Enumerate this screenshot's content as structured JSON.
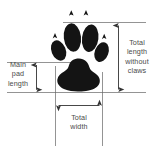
{
  "diagram": {
    "background_color": "#ffffff",
    "ink_color": "#111111",
    "line_color": "#555555",
    "text_color": "#4a4a4a",
    "labels": {
      "total_length_without_claws": "Total\nlength\nwithout\nclaws",
      "main_pad_length": "Main\npad\nlength",
      "total_width": "Total\nwidth"
    },
    "parts": {
      "toe_pads": 4,
      "claw_marks": 4,
      "main_pad": 1
    },
    "dimensions": [
      {
        "name": "total-length-without-claws",
        "orientation": "vertical",
        "arrow": "double-headed"
      },
      {
        "name": "main-pad-length",
        "orientation": "vertical",
        "arrow": "double-headed"
      },
      {
        "name": "total-width",
        "orientation": "horizontal",
        "arrow": "double-headed"
      }
    ]
  }
}
